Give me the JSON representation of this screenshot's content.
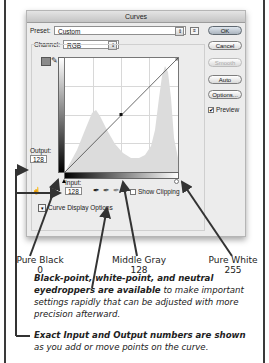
{
  "dialog": {
    "title": "Curves",
    "preset_label": "Preset:",
    "preset_value": "Custom",
    "channel_label": "Channel:",
    "channel_value": "RGB",
    "buttons": {
      "ok": "OK",
      "cancel": "Cancel",
      "smooth": "Smooth",
      "auto": "Auto",
      "options": "Options..."
    },
    "preview_label": "Preview",
    "preview_checked": true,
    "output_label": "Output:",
    "output_value": "128",
    "input_label": "Input:",
    "input_value": "128",
    "show_clipping_label": "Show Clipping",
    "show_clipping_checked": false,
    "curve_display_options_label": "Curve Display Options"
  },
  "callouts": {
    "pure_black": {
      "name": "Pure Black",
      "value": "0"
    },
    "middle_gray": {
      "name": "Middle Gray",
      "value": "128"
    },
    "pure_white": {
      "name": "Pure White",
      "value": "255"
    }
  },
  "notes": [
    {
      "bold": "Black-point, white-point, and neutral eyedroppers are available",
      "rest": " to make important settings rapidly that can be adjusted with more precision afterward."
    },
    {
      "bold": "Exact Input and Output numbers are shown",
      "rest": " as you add or move points on the curve."
    }
  ],
  "colors": {
    "arrow": "#333333",
    "histogram": "#d9d9d9",
    "dialog_bg": "#ececec"
  }
}
